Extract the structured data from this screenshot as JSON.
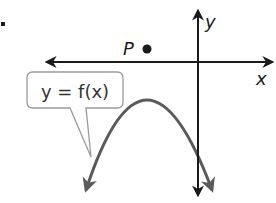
{
  "figure": {
    "list_marker": ".",
    "axes": {
      "x_label": "x",
      "y_label": "y",
      "axis_color": "#1a1a1a"
    },
    "point": {
      "label": "P",
      "color": "#1a1a1a"
    },
    "curve": {
      "type": "downward-opening parabola",
      "color": "#5a5a5a"
    },
    "callout": {
      "text": "y = f(x)",
      "border_color": "#9a9a9a",
      "fill": "#ffffff"
    }
  }
}
